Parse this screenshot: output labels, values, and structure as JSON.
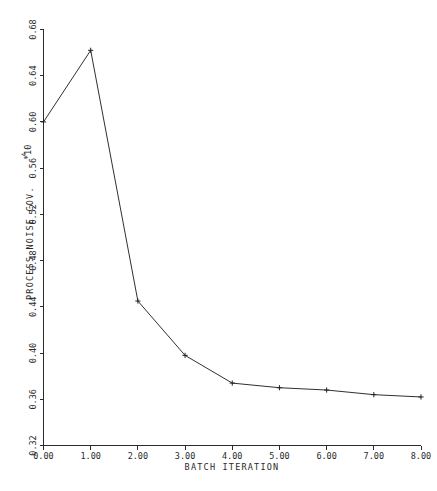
{
  "chart_data": {
    "type": "line",
    "title": "",
    "xlabel": "BATCH ITERATION",
    "ylabel": "PROCESS NOISE COV.",
    "y_scale_label": "*10",
    "y_scale_exponent": "-4",
    "x": [
      0,
      1,
      2,
      3,
      4,
      5,
      6,
      7,
      8
    ],
    "values": [
      0.6,
      0.662,
      0.445,
      0.398,
      0.374,
      0.37,
      0.368,
      0.364,
      0.362
    ],
    "xlim": [
      0.0,
      8.0
    ],
    "ylim": [
      0.32,
      0.68
    ],
    "xticks": [
      "0.00",
      "1.00",
      "2.00",
      "3.00",
      "4.00",
      "5.00",
      "6.00",
      "7.00",
      "8.00"
    ],
    "xtick_values": [
      0,
      1,
      2,
      3,
      4,
      5,
      6,
      7,
      8
    ],
    "yticks": [
      "0.32",
      "0.36",
      "0.40",
      "0.44",
      "0.48",
      "0.52",
      "0.56",
      "0.60",
      "0.64",
      "0.68"
    ],
    "ytick_values": [
      0.32,
      0.36,
      0.4,
      0.44,
      0.48,
      0.52,
      0.56,
      0.6,
      0.64,
      0.68
    ],
    "grid": false,
    "legend": null,
    "marker": "plus",
    "line_color": "#303030",
    "axis_color": "#2b2b2b",
    "background": "#ffffff"
  },
  "figure": {
    "caption": ""
  }
}
